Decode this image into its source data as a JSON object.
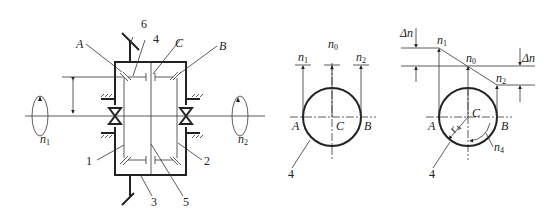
{
  "figure": {
    "panels": [
      {
        "id": "mechanism",
        "description": "Differential gear train schematic",
        "labels": {
          "A": "A",
          "B": "B",
          "C": "C",
          "part1": "1",
          "part2": "2",
          "part3": "3",
          "part4": "4",
          "part5": "5",
          "part6": "6",
          "n1_base": "n",
          "n1_sub": "1",
          "n2_base": "n",
          "n2_sub": "2"
        }
      },
      {
        "id": "velocity-equal",
        "description": "Speed diagram with n1 = n2 = n0",
        "labels": {
          "n1_base": "n",
          "n1_sub": "1",
          "n0_base": "n",
          "n0_sub": "0",
          "n2_base": "n",
          "n2_sub": "2",
          "A": "A",
          "B": "B",
          "C": "C",
          "part4": "4"
        }
      },
      {
        "id": "velocity-differential",
        "description": "Speed diagram with n1 > n0 > n2 and planet rotation n4",
        "labels": {
          "delta_n_left": "Δn",
          "delta_n_right": "Δn",
          "n1_base": "n",
          "n1_sub": "1",
          "n0_base": "n",
          "n0_sub": "0",
          "n2_base": "n",
          "n2_sub": "2",
          "n4_base": "n",
          "n4_sub": "4",
          "r4_base": "r",
          "r4_sub": "4",
          "A": "A",
          "B": "B",
          "C": "C",
          "part4": "4"
        }
      }
    ]
  }
}
